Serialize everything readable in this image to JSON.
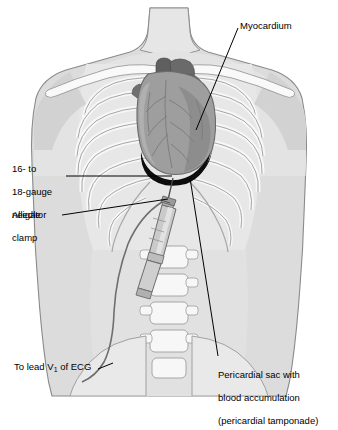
{
  "figure": {
    "view": "anterior torso"
  },
  "labels": {
    "myocardium": "Myocardium",
    "needle_line1": "16- to",
    "needle_line2": "18-gauge",
    "needle_line3": "needle",
    "clamp_line1": "Alligator",
    "clamp_line2": "clamp",
    "ecg_prefix": "To lead V",
    "ecg_sub": "1",
    "ecg_suffix": " of ECG",
    "peri_line1": "Pericardial sac with",
    "peri_line2": "blood accumulation",
    "peri_line3": "(pericardial tamponade)"
  },
  "colors": {
    "body_fill": "#dcdcdc",
    "body_edge": "#8a8a8a",
    "skin_light": "#ededed",
    "bone_fill": "#f7f7f7",
    "bone_edge": "#9a9a9a",
    "cavity_fill": "#e4e4e4",
    "heart_fill": "#9e9e9e",
    "heart_edge": "#6f6f6f",
    "heart_shade": "#8a8a8a",
    "vessel_dark": "#5f5f5f",
    "blood_black": "#0d0d0d",
    "syringe_fill": "#c9c9c9",
    "syringe_edge": "#6b6b6b",
    "wire": "#6e6e6e",
    "leader": "#000000",
    "text": "#000000"
  },
  "parts": {
    "heart": "myocardium",
    "pericardial_effusion": "blood accumulation crescent",
    "needle": "16- to 18-gauge needle",
    "syringe": "aspiration syringe",
    "clamp": "alligator clamp",
    "wire": "ECG lead wire",
    "ribs": "rib cage",
    "clavicles": "clavicles",
    "spine": "lumbar vertebrae",
    "pelvis": "pelvic girdle"
  }
}
